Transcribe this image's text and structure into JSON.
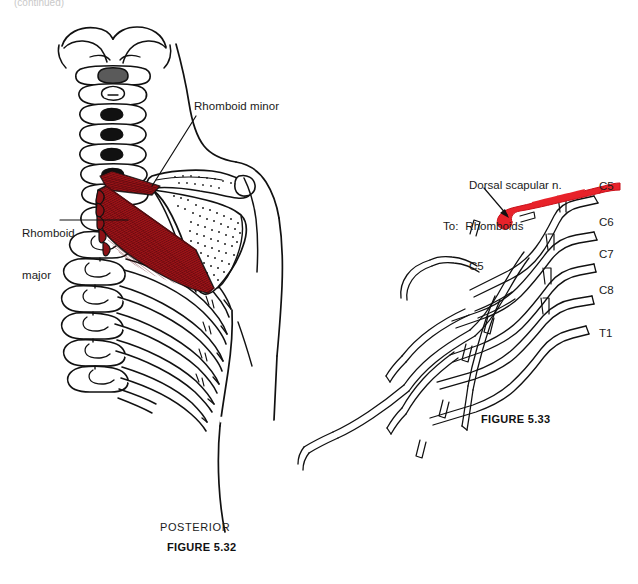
{
  "page": {
    "top_note": "(continued)",
    "background_color": "#ffffff",
    "width": 638,
    "height": 584
  },
  "colors": {
    "ink": "#111111",
    "muscle_red": "#9e1418",
    "muscle_red_dark": "#7d0f13",
    "nerve_red": "#e8222a",
    "stipple": "#2a2a2a"
  },
  "figure_532": {
    "caption": "FIGURE 5.32",
    "orientation": "POSTERIOR",
    "title_region": "posterior thorax, scapula and rhomboid muscles",
    "labels": [
      {
        "id": "rhomboid-major",
        "text": "Rhomboid\nmajor",
        "line1": "Rhomboid",
        "line2": "major"
      },
      {
        "id": "rhomboid-minor",
        "text": "Rhomboid minor",
        "line1": "Rhomboid minor",
        "line2": ""
      }
    ],
    "structures": [
      "cervical vertebrae",
      "thoracic vertebrae",
      "ribs",
      "scapula",
      "rhomboid major muscle",
      "rhomboid minor muscle",
      "body outline",
      "arm outline"
    ]
  },
  "figure_533": {
    "caption": "FIGURE 5.33",
    "title_region": "brachial plexus with dorsal scapular nerve highlighted",
    "nerve_label": {
      "line1": "Dorsal scapular n.",
      "prefix": "To:",
      "line2": "Rhomboids",
      "line3": "C5"
    },
    "roots": [
      {
        "id": "c5",
        "label": "C5"
      },
      {
        "id": "c6",
        "label": "C6"
      },
      {
        "id": "c7",
        "label": "C7"
      },
      {
        "id": "c8",
        "label": "C8"
      },
      {
        "id": "t1",
        "label": "T1"
      }
    ],
    "highlighted_nerve": "dorsal scapular nerve"
  }
}
